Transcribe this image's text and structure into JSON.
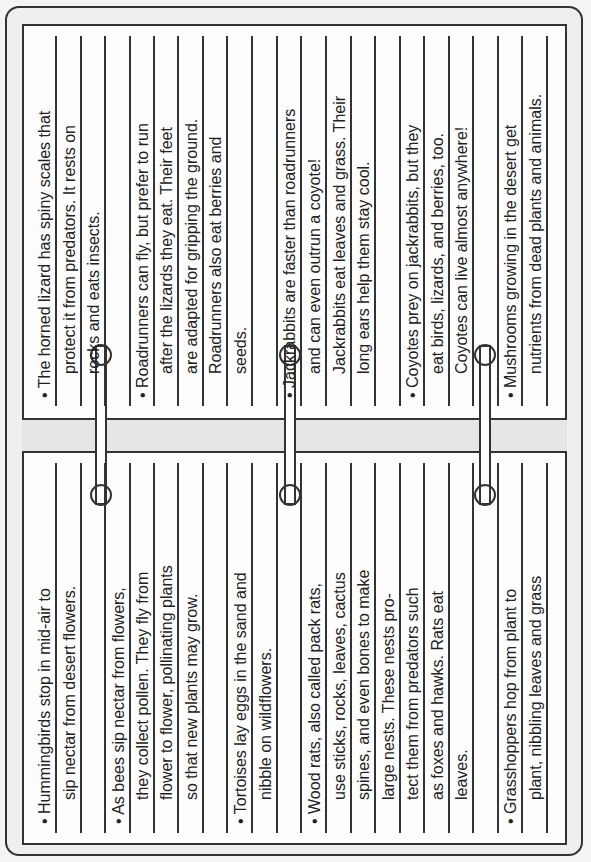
{
  "document": {
    "orientation": "rotated-90-ccw",
    "layout": "two-page ring notebook",
    "top_page": {
      "entries": [
        {
          "lines": [
            "• The horned lizard has spiny scales that",
            "protect it from predators. It rests on",
            "rocks and eats insects."
          ]
        },
        {
          "lines": [
            "• Roadrunners can fly, but prefer to run",
            "after the lizards they eat. Their feet",
            "are adapted for gripping the ground.",
            "Roadrunners also eat berries and",
            "seeds."
          ]
        },
        {
          "lines": [
            "• Jackrabbits are faster than roadrunners",
            "and can even outrun a coyote!",
            "Jackrabbits eat leaves and grass. Their",
            "long ears help them stay cool."
          ]
        },
        {
          "lines": [
            "• Coyotes prey on jackrabbits, but they",
            "eat birds, lizards, and berries, too.",
            "Coyotes can live almost anywhere!"
          ]
        },
        {
          "lines": [
            "• Mushrooms growing in the desert get",
            "nutrients from dead plants and animals."
          ]
        }
      ]
    },
    "bottom_page": {
      "entries": [
        {
          "lines": [
            "• Hummingbirds stop in mid-air to",
            "sip nectar from desert flowers."
          ]
        },
        {
          "lines": [
            "• As bees sip nectar from flowers,",
            "they collect pollen. They fly from",
            "flower to flower, pollinating plants",
            "so that new plants may grow."
          ]
        },
        {
          "lines": [
            "• Tortoises lay eggs in the sand and",
            "nibble on wildflowers."
          ]
        },
        {
          "lines": [
            "• Wood rats, also called pack rats,",
            "use sticks, rocks, leaves, cactus",
            "spines, and even bones to make",
            "large nests. These nests pro-",
            "tect them from predators such",
            "as foxes and hawks. Rats eat",
            "leaves."
          ]
        },
        {
          "lines": [
            "• Grasshoppers hop from plant to",
            "plant, nibbling leaves and grass",
            "and jumping to escape predators."
          ]
        }
      ]
    },
    "colors": {
      "ink": "#333333",
      "paper": "#fdfdfd",
      "background": "#efefef",
      "spine": "#e6e6e6"
    }
  },
  "top_lines": [
    {
      "x": 56,
      "text": "• The horned lizard has spiny scales that",
      "indent": false
    },
    {
      "x": 81,
      "text": "protect it from predators. It rests on",
      "indent": true
    },
    {
      "x": 105,
      "text": "rocks and eats insects.",
      "indent": true
    },
    {
      "x": 130,
      "text": "",
      "indent": false
    },
    {
      "x": 154,
      "text": "• Roadrunners can fly, but prefer to run",
      "indent": false
    },
    {
      "x": 178,
      "text": "after the lizards they eat. Their feet",
      "indent": true
    },
    {
      "x": 203,
      "text": "are adapted for gripping the ground.",
      "indent": true
    },
    {
      "x": 227,
      "text": "Roadrunners also eat berries and",
      "indent": true
    },
    {
      "x": 252,
      "text": "seeds.",
      "indent": true
    },
    {
      "x": 277,
      "text": "",
      "indent": false
    },
    {
      "x": 301,
      "text": "• Jackrabbits are faster than roadrunners",
      "indent": false
    },
    {
      "x": 326,
      "text": "and can even outrun a coyote!",
      "indent": true
    },
    {
      "x": 351,
      "text": "Jackrabbits eat leaves and grass. Their",
      "indent": true
    },
    {
      "x": 375,
      "text": "long ears help them stay cool.",
      "indent": true
    },
    {
      "x": 400,
      "text": "",
      "indent": false
    },
    {
      "x": 424,
      "text": "• Coyotes prey on jackrabbits, but they",
      "indent": false
    },
    {
      "x": 449,
      "text": "eat birds, lizards, and berries, too.",
      "indent": true
    },
    {
      "x": 473,
      "text": "Coyotes can live almost anywhere!",
      "indent": true
    },
    {
      "x": 498,
      "text": "",
      "indent": false
    },
    {
      "x": 522,
      "text": "• Mushrooms growing in the desert get",
      "indent": false
    },
    {
      "x": 547,
      "text": "nutrients from dead plants and animals.",
      "indent": true
    }
  ],
  "bottom_lines": [
    {
      "x": 56,
      "text": "• Hummingbirds stop in mid-air to",
      "indent": false
    },
    {
      "x": 81,
      "text": "sip nectar from desert flowers.",
      "indent": true
    },
    {
      "x": 105,
      "text": "",
      "indent": false
    },
    {
      "x": 130,
      "text": "• As bees sip nectar from flowers,",
      "indent": false
    },
    {
      "x": 154,
      "text": "they collect pollen. They fly from",
      "indent": true
    },
    {
      "x": 178,
      "text": "flower to flower, pollinating plants",
      "indent": true
    },
    {
      "x": 203,
      "text": "so that new plants may grow.",
      "indent": true
    },
    {
      "x": 227,
      "text": "",
      "indent": false
    },
    {
      "x": 252,
      "text": "• Tortoises lay eggs in the sand and",
      "indent": false
    },
    {
      "x": 277,
      "text": "nibble on wildflowers.",
      "indent": true
    },
    {
      "x": 301,
      "text": "",
      "indent": false
    },
    {
      "x": 326,
      "text": "• Wood rats, also called pack rats,",
      "indent": false
    },
    {
      "x": 351,
      "text": "use sticks, rocks, leaves, cactus",
      "indent": true
    },
    {
      "x": 375,
      "text": "spines, and even bones to make",
      "indent": true
    },
    {
      "x": 400,
      "text": "large nests. These nests pro-",
      "indent": true
    },
    {
      "x": 424,
      "text": "tect them from predators such",
      "indent": true
    },
    {
      "x": 449,
      "text": "as foxes and hawks. Rats eat",
      "indent": true
    },
    {
      "x": 473,
      "text": "leaves.",
      "indent": true
    },
    {
      "x": 498,
      "text": "",
      "indent": false
    },
    {
      "x": 522,
      "text": "• Grasshoppers hop from plant to",
      "indent": false
    },
    {
      "x": 547,
      "text": "plant, nibbling leaves and grass",
      "indent": true
    },
    {
      "x": 571,
      "text": "and jumping to escape predators.",
      "indent": true
    }
  ],
  "rings": [
    {
      "x": 101
    },
    {
      "x": 290
    },
    {
      "x": 485
    }
  ]
}
